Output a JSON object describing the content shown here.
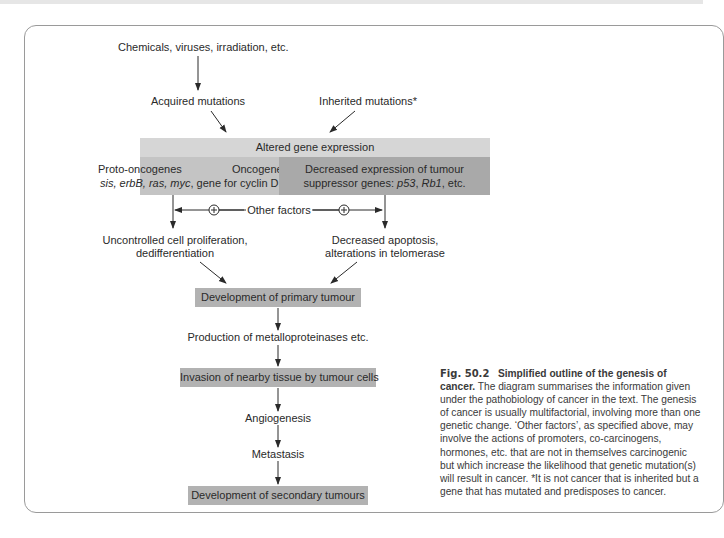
{
  "diagram": {
    "top_cause": "Chemicals, viruses, irradiation, etc.",
    "acquired": "Acquired mutations",
    "inherited": "Inherited mutations*",
    "altered": "Altered gene expression",
    "left_box": {
      "line1_a": "Proto-oncogenes",
      "line1_b": "Oncogenes",
      "line2_genes": "sis, erbB, ras, myc",
      "line2_rest": ", gene for cyclin D, etc."
    },
    "right_box": {
      "line1": "Decreased expression of tumour",
      "line2_a": "suppressor genes: ",
      "line2_g1": "p53",
      "line2_sep": ", ",
      "line2_g2": "Rb1",
      "line2_end": ", etc."
    },
    "other_factors": "Other factors",
    "plus_symbol": "+",
    "left_outcome": {
      "line1": "Uncontrolled cell proliferation,",
      "line2": "dedifferentiation"
    },
    "right_outcome": {
      "line1": "Decreased apoptosis,",
      "line2": "alterations in telomerase"
    },
    "primary": "Development of primary tumour",
    "metallo": "Production of metalloproteinases etc.",
    "invasion": "Invasion of nearby tissue by tumour cells",
    "angio": "Angiogenesis",
    "metastasis": "Metastasis",
    "secondary": "Development of secondary tumours"
  },
  "caption": {
    "fig_label": "Fig. 50.2",
    "title": "Simplified outline of the genesis of cancer.",
    "body": " The diagram summarises the information given under the pathobiology of cancer in the text. The genesis of cancer is usually multifactorial, involving more than one genetic change. ‘Other factors’, as specified above, may involve the actions of promoters, co-carcinogens, hormones, etc. that are not in themselves carcinogenic but which increase the likelihood that genetic mutation(s) will result in cancer. *It is not cancer that is inherited but a gene that has mutated and predisposes to cancer."
  },
  "colors": {
    "band": "#d6d6d6",
    "left_box": "#c4c4c4",
    "right_box": "#a9a9a9",
    "stage_box": "#b2b2b2",
    "frame": "#9a9a9a"
  }
}
